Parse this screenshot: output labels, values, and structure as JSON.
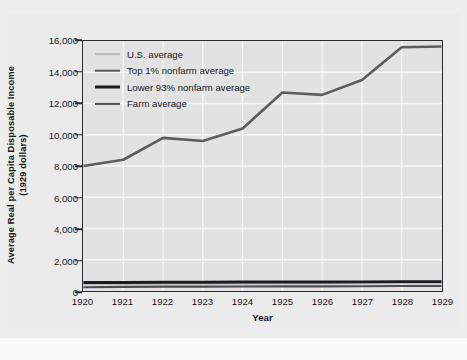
{
  "chart_data": {
    "type": "line",
    "title": "",
    "xlabel": "Year",
    "ylabel": "Average Real per Capita Disposable Income\n(1929 dollars)",
    "ylabel_line1": "Average Real per Capita Disposable Income",
    "ylabel_line2": "(1929 dollars)",
    "x": [
      1920,
      1921,
      1922,
      1923,
      1924,
      1925,
      1926,
      1927,
      1928,
      1929
    ],
    "xtick_labels": [
      "1920",
      "1921",
      "1922",
      "1923",
      "1924",
      "1925",
      "1926",
      "1927",
      "1928",
      "1929"
    ],
    "ytick_labels": [
      "0",
      "2,000",
      "4,000",
      "6,000",
      "8,000",
      "10,000",
      "12,000",
      "14,000",
      "16,000"
    ],
    "ytick_values": [
      0,
      2000,
      4000,
      6000,
      8000,
      10000,
      12000,
      14000,
      16000
    ],
    "ylim": [
      0,
      16000
    ],
    "xlim": [
      1920,
      1929
    ],
    "grid": true,
    "legend_position": "upper-left",
    "series": [
      {
        "name": "U.S. average",
        "color": "#b9b9b9",
        "width": 1.7,
        "values": [
          430,
          440,
          450,
          450,
          460,
          470,
          470,
          470,
          480,
          480
        ]
      },
      {
        "name": "Top 1% nonfarm average",
        "color": "#5a5c60",
        "width": 2.6,
        "values": [
          8000,
          8400,
          9800,
          9600,
          10400,
          12700,
          12550,
          13500,
          15600,
          15650
        ]
      },
      {
        "name": "Lower 93% nonfarm average",
        "color": "#1b1c1f",
        "width": 3.0,
        "values": [
          540,
          545,
          560,
          555,
          570,
          580,
          580,
          585,
          600,
          600
        ]
      },
      {
        "name": "Farm average",
        "color": "#4b4d51",
        "width": 2.2,
        "values": [
          240,
          260,
          275,
          280,
          290,
          300,
          300,
          305,
          320,
          320
        ]
      }
    ]
  },
  "legend": {
    "entries": [
      {
        "label": "U.S. average"
      },
      {
        "label": "Top 1% nonfarm average"
      },
      {
        "label": "Lower 93% nonfarm average"
      },
      {
        "label": "Farm average"
      }
    ]
  },
  "colors": {
    "figure_background": "#eeeeee",
    "plot_background": "#e2e2e2",
    "gridline": "#f7f7f7",
    "axis": "#2a2b2e",
    "text": "#16171a"
  },
  "bottom_caption": ""
}
